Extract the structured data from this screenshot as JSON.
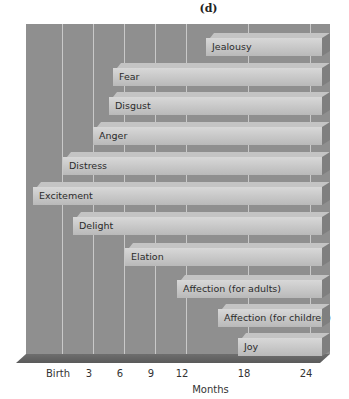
{
  "panel_label": "(d)",
  "chart_data": {
    "type": "bar",
    "orientation": "horizontal-timeline",
    "title": "",
    "xlabel": "Months",
    "ylabel": "",
    "x_ticks": [
      "Birth",
      "3",
      "6",
      "9",
      "12",
      "18",
      "24"
    ],
    "x_tick_values": [
      0,
      3,
      6,
      9,
      12,
      18,
      24
    ],
    "xlim": [
      -1,
      25
    ],
    "grid": true,
    "legend": null,
    "categories": [
      "Jealousy",
      "Fear",
      "Disgust",
      "Anger",
      "Distress",
      "Excitement",
      "Delight",
      "Elation",
      "Affection (for adults)",
      "Affection (for children)",
      "Joy"
    ],
    "onset_months": [
      14.5,
      5,
      4.5,
      3,
      0,
      -1,
      1,
      6,
      11,
      15,
      17
    ],
    "end_months": [
      25,
      25,
      25,
      25,
      25,
      25,
      25,
      25,
      25,
      25,
      25
    ]
  },
  "bars": [
    {
      "label": "Jealousy",
      "left": 206,
      "top": 33
    },
    {
      "label": "Fear",
      "left": 113,
      "top": 63
    },
    {
      "label": "Disgust",
      "left": 109,
      "top": 92
    },
    {
      "label": "Anger",
      "left": 93,
      "top": 122
    },
    {
      "label": "Distress",
      "left": 63,
      "top": 152
    },
    {
      "label": "Excitement",
      "left": 33,
      "top": 182
    },
    {
      "label": "Delight",
      "left": 73,
      "top": 212
    },
    {
      "label": "Elation",
      "left": 125,
      "top": 243
    },
    {
      "label": "Affection (for adults)",
      "left": 177,
      "top": 275
    },
    {
      "label": "Affection (for children)",
      "left": 218,
      "top": 304
    },
    {
      "label": "Joy",
      "left": 238,
      "top": 333
    }
  ],
  "ticks": [
    {
      "label": "Birth",
      "x": 62
    },
    {
      "label": "3",
      "x": 93
    },
    {
      "label": "6",
      "x": 124
    },
    {
      "label": "9",
      "x": 155
    },
    {
      "label": "12",
      "x": 186
    },
    {
      "label": "18",
      "x": 248
    },
    {
      "label": "24",
      "x": 310
    }
  ],
  "colors": {
    "wall": "#8f8f8f",
    "gridline": "#c9c9c9",
    "bar_front": "#cccccc",
    "bar_top": "#c4c4c4",
    "bar_side": "#7f7f7f",
    "floor": "#666666"
  }
}
